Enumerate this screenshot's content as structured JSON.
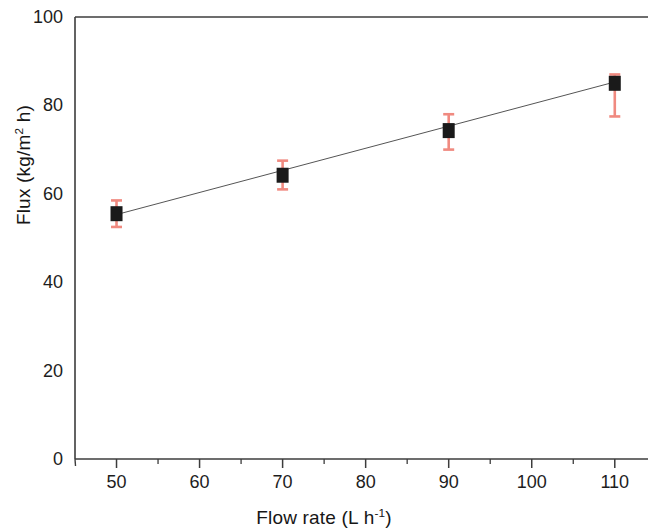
{
  "figure": {
    "width": 648,
    "height": 531,
    "background": "#ffffff"
  },
  "chart_data": {
    "type": "scatter",
    "title": "",
    "subtitle": "",
    "xlabel_parts": {
      "main": "Flow rate (L h",
      "exponent": "-1",
      "tail": ")"
    },
    "xlabel": "Flow rate (L h-1)",
    "ylabel_parts": {
      "main": "Flux (kg/m",
      "exponent": "2",
      "tail": " h)"
    },
    "ylabel": "Flux (kg/m2 h)",
    "x": [
      50,
      70,
      90,
      110
    ],
    "values": [
      55.5,
      64.2,
      74.3,
      85.0
    ],
    "yerr_lower": [
      3.0,
      3.2,
      4.3,
      7.5
    ],
    "yerr_upper": [
      3.0,
      3.3,
      3.7,
      2.0
    ],
    "series": [
      {
        "name": "Flux vs flow rate",
        "values": [
          55.5,
          64.2,
          74.3,
          85.0
        ],
        "marker": "filled-square",
        "marker_color": "#1a1a1a",
        "errorbar_color": "#f08a80"
      },
      {
        "name": "Linear fit",
        "type": "line",
        "x": [
          50,
          110
        ],
        "values": [
          55.3,
          85.3
        ],
        "line_color": "#555555",
        "line_style": "solid",
        "line_width": 1
      }
    ],
    "xlim": [
      45,
      114
    ],
    "ylim": [
      0,
      100
    ],
    "xticks": [
      50,
      60,
      70,
      80,
      90,
      100,
      110
    ],
    "xtick_labels": [
      "50",
      "60",
      "70",
      "80",
      "90",
      "100",
      "110"
    ],
    "xminor_ticks": [
      55,
      65,
      75,
      85,
      95,
      105
    ],
    "yticks": [
      0,
      20,
      40,
      60,
      80,
      100
    ],
    "ytick_labels": [
      "0",
      "20",
      "40",
      "60",
      "80",
      "100"
    ],
    "grid": false,
    "legend": "none",
    "axis_color": "#3c3c3c",
    "frame": [
      "left",
      "bottom",
      "top"
    ]
  }
}
